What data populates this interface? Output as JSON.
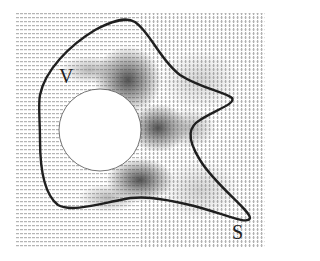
{
  "figure": {
    "labels": {
      "volume": "V",
      "surface": "S"
    },
    "colors": {
      "background": "#ffffff",
      "curve": "#1f1f1f",
      "field_light": "#c8c8c8",
      "field_dark": "#3a3a3a",
      "obstacle": "#ffffff"
    },
    "field_bounds": {
      "x0": 16,
      "y0": 13,
      "x1": 265,
      "y1": 247
    },
    "obstacle": {
      "shape": "circle",
      "cx": 100,
      "cy": 130,
      "r": 41
    },
    "label_positions": {
      "volume": {
        "x": 59,
        "y": 66
      },
      "surface": {
        "x": 232,
        "y": 222
      }
    }
  }
}
